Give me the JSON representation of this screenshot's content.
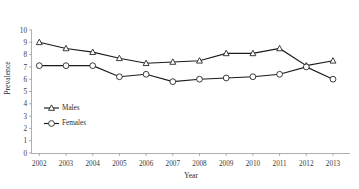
{
  "chart_data": {
    "type": "line",
    "title": "",
    "xlabel": "Year",
    "ylabel": "Prevalence",
    "categories": [
      "2002",
      "2003",
      "2004",
      "2005",
      "2006",
      "2007",
      "2008",
      "2009",
      "2010",
      "2011",
      "2012",
      "2013"
    ],
    "x": [
      2002,
      2003,
      2004,
      2005,
      2006,
      2007,
      2008,
      2009,
      2010,
      2011,
      2012,
      2013
    ],
    "series": [
      {
        "name": "Males",
        "marker": "triangle",
        "color": "#1a1a1a",
        "values": [
          9.0,
          8.5,
          8.2,
          7.7,
          7.3,
          7.4,
          7.5,
          8.1,
          8.1,
          8.5,
          7.1,
          7.5
        ]
      },
      {
        "name": "Females",
        "marker": "circle",
        "color": "#1a1a1a",
        "values": [
          7.1,
          7.1,
          7.1,
          6.2,
          6.4,
          5.8,
          6.0,
          6.1,
          6.2,
          6.4,
          7.0,
          6.0
        ]
      }
    ],
    "ylim": [
      0,
      10
    ],
    "ytick_labels": [
      "0",
      "1",
      "2",
      "3",
      "4",
      "5",
      "6",
      "7",
      "8",
      "9",
      "10"
    ],
    "yticks": [
      0,
      1,
      2,
      3,
      4,
      5,
      6,
      7,
      8,
      9,
      10
    ],
    "grid": false,
    "legend_position": "inside-lower-left",
    "legend": [
      "Males",
      "Females"
    ]
  },
  "axes": {
    "y_title": "Prevalence",
    "x_title": "Year"
  },
  "legend": {
    "entries": [
      {
        "label": "Males",
        "marker_icon": "triangle-marker-icon"
      },
      {
        "label": "Females",
        "marker_icon": "circle-marker-icon"
      }
    ]
  }
}
